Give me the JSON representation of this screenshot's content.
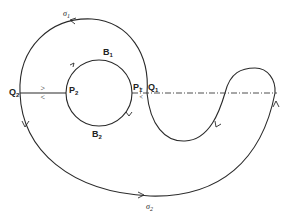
{
  "diagram": {
    "type": "phase-portrait / orbit diagram",
    "labels": {
      "sigma1": {
        "base": "σ",
        "sub": "1"
      },
      "sigma2": {
        "base": "σ",
        "sub": "2"
      },
      "B1": {
        "base": "B",
        "sub": "1"
      },
      "B2": {
        "base": "B",
        "sub": "2"
      },
      "P1": {
        "base": "P",
        "sub": "1"
      },
      "P2": {
        "base": "P",
        "sub": "2"
      },
      "Q1": {
        "base": "Q",
        "sub": "1"
      },
      "Q2": {
        "base": "Q",
        "sub": "2"
      }
    },
    "elements": [
      {
        "id": "inner-circle",
        "description": "Circle through P1, B1, P2, B2"
      },
      {
        "id": "sigma1-arc",
        "description": "Upper outer arc from Q1 to Q2 with arrow"
      },
      {
        "id": "sigma2-arc",
        "description": "Lower outer arc from Q2 to the right with arrow"
      },
      {
        "id": "s-curve",
        "description": "S-shaped curve from Q1 down, up and around to the right"
      },
      {
        "id": "segment-Q2-P2",
        "description": "Solid segment joining Q2 and P2 with double arrows"
      },
      {
        "id": "dashdot-axis",
        "description": "Dash-dot line from P1 through Q1 to the right end"
      }
    ],
    "double_arrow_glyphs": {
      "right": ">",
      "left": "<"
    }
  }
}
